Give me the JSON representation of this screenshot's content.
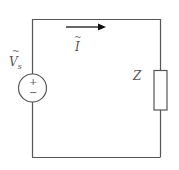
{
  "diagram": {
    "type": "circuit",
    "title": "",
    "components": [
      {
        "id": "source",
        "kind": "ac-voltage-source",
        "label": "V",
        "label_subscript": "s",
        "label_accent": "~",
        "polarity": {
          "top": "+",
          "bottom": "−"
        }
      },
      {
        "id": "load",
        "kind": "impedance",
        "label": "Z"
      }
    ],
    "current": {
      "label": "I",
      "label_accent": "~",
      "direction": "right"
    },
    "colors": {
      "wire": "#555555",
      "text": "#555555",
      "arrow": "#111111"
    }
  },
  "labels": {
    "source_tilde": "~",
    "source_main": "V",
    "source_sub": "s",
    "plus": "+",
    "minus": "−",
    "current_tilde": "~",
    "current_main": "I",
    "load": "Z"
  }
}
